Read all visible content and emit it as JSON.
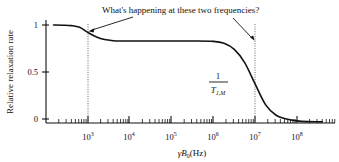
{
  "chart_data": {
    "type": "line",
    "title": "",
    "xlabel": "γB₀(Hz)",
    "ylabel": "Relative relaxation rate",
    "xscale": "log",
    "xlim": [
      150,
      400000000
    ],
    "ylim": [
      -0.08,
      1.08
    ],
    "grid": false,
    "legend": null,
    "yticks": [
      {
        "value": 0,
        "label": "0"
      },
      {
        "value": 0.5,
        "label": "0.5"
      },
      {
        "value": 1,
        "label": "1"
      }
    ],
    "xticks": [
      {
        "value": 1000,
        "mantissa": "10",
        "exponent": "3"
      },
      {
        "value": 10000,
        "mantissa": "10",
        "exponent": "4"
      },
      {
        "value": 100000,
        "mantissa": "10",
        "exponent": "5"
      },
      {
        "value": 1000000,
        "mantissa": "10",
        "exponent": "6"
      },
      {
        "value": 10000000,
        "mantissa": "10",
        "exponent": "7"
      },
      {
        "value": 100000000,
        "mantissa": "10",
        "exponent": "8"
      }
    ],
    "series": [
      {
        "name": "Relative relaxation rate",
        "comment": "Two-step dispersion curve: plateau 1.0 -> 0.83 near 1e3, then 0.83 -> -0.03 near 1e7",
        "x": [
          150,
          250,
          400,
          630,
          1000,
          1600,
          2500,
          4000,
          6300,
          10000,
          31600,
          100000,
          316000,
          1000000,
          1800000,
          3160000,
          5600000,
          10000000,
          17800000,
          31600000,
          56000000,
          100000000,
          178000000,
          316000000,
          400000000
        ],
        "y": [
          1.0,
          0.998,
          0.993,
          0.975,
          0.92,
          0.872,
          0.845,
          0.833,
          0.83,
          0.83,
          0.83,
          0.83,
          0.83,
          0.826,
          0.805,
          0.74,
          0.6,
          0.37,
          0.15,
          0.04,
          0.0,
          -0.02,
          -0.028,
          -0.03,
          -0.03
        ]
      }
    ],
    "vertical_markers": [
      {
        "value": 1000,
        "label": "10^3",
        "style": "dotted"
      },
      {
        "value": 10000000,
        "label": "10^7",
        "style": "dotted"
      }
    ],
    "annotations": [
      {
        "id": "question-annotation",
        "text": "What's happening at these two frequencies?",
        "x_px": 102,
        "y_px": 13,
        "arrows": [
          {
            "from_px": [
              133,
              17
            ],
            "to_px": [
              89,
              31
            ]
          },
          {
            "from_px": [
              233,
              18
            ],
            "to_px": [
              254,
              41
            ]
          }
        ]
      },
      {
        "id": "rate-label",
        "numerator": "1",
        "denominator_main": "T",
        "denominator_sub": "1,M",
        "x_px": 218,
        "y_px": 82
      }
    ]
  },
  "axes": {
    "y_label": "Relative relaxation rate",
    "x_label_gamma": "γ",
    "x_label_b": "B",
    "x_label_b_sub": "0",
    "x_label_units": "(Hz)"
  },
  "colors": {
    "background": "#ffffff",
    "curve": "#111111",
    "axis": "#111111",
    "marker": "#555555",
    "text": "#111111"
  }
}
